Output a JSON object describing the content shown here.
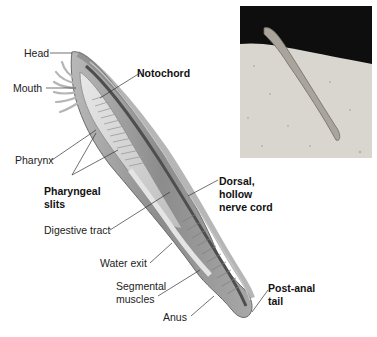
{
  "figure": {
    "type": "anatomical diagram",
    "labels": {
      "head": "Head",
      "mouth": "Mouth",
      "notochord": "Notochord",
      "pharynx": "Pharynx",
      "pharyngeal_slits_1": "Pharyngeal",
      "pharyngeal_slits_2": "slits",
      "digestive_tract": "Digestive tract",
      "dorsal_nerve_cord_1": "Dorsal,",
      "dorsal_nerve_cord_2": "hollow",
      "dorsal_nerve_cord_3": "nerve cord",
      "water_exit": "Water exit",
      "segmental_muscles_1": "Segmental",
      "segmental_muscles_2": "muscles",
      "anus": "Anus",
      "post_anal_tail_1": "Post-anal",
      "post_anal_tail_2": "tail"
    },
    "bold_labels": [
      "Notochord",
      "Pharyngeal slits",
      "Dorsal, hollow nerve cord",
      "Post-anal tail"
    ],
    "inset_photo": "Lancelet partially buried in sand against a dark background",
    "colors": {
      "body_fill": "#9a9a9a",
      "body_dark": "#6e6e6e",
      "interior_light": "#d6d6d6",
      "notochord": "#555555",
      "leader_line": "#333333",
      "photo_bg": "#111111",
      "sand": "#d9d6cf"
    }
  }
}
